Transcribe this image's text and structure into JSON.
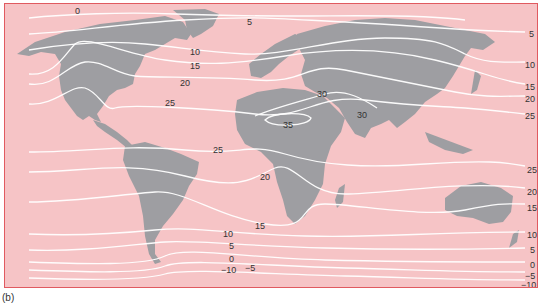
{
  "figure": {
    "caption": "(b)",
    "type": "isotherm world map",
    "colors": {
      "ocean": "#f6c4c6",
      "land": "#9e9ea2",
      "isotherm": "#ffffff",
      "border": "#e05a60",
      "text": "#333333"
    }
  },
  "labels": [
    {
      "id": "l0",
      "text": "0",
      "x": 70,
      "y": 5
    },
    {
      "id": "l5a",
      "text": "5",
      "x": 242,
      "y": 14
    },
    {
      "id": "l10a",
      "text": "10",
      "x": 185,
      "y": 44
    },
    {
      "id": "l15a",
      "text": "15",
      "x": 185,
      "y": 58
    },
    {
      "id": "l20a",
      "text": "20",
      "x": 175,
      "y": 75
    },
    {
      "id": "l25a",
      "text": "25",
      "x": 160,
      "y": 95
    },
    {
      "id": "l30a",
      "text": "30",
      "x": 312,
      "y": 86
    },
    {
      "id": "l35",
      "text": "35",
      "x": 278,
      "y": 117
    },
    {
      "id": "l30b",
      "text": "30",
      "x": 352,
      "y": 107
    },
    {
      "id": "l25b",
      "text": "25",
      "x": 208,
      "y": 142
    },
    {
      "id": "l5r",
      "text": "5",
      "x": 524,
      "y": 26
    },
    {
      "id": "l10r",
      "text": "10",
      "x": 524,
      "y": 57
    },
    {
      "id": "l15r",
      "text": "15",
      "x": 524,
      "y": 79
    },
    {
      "id": "l20r",
      "text": "20",
      "x": 524,
      "y": 91
    },
    {
      "id": "l25r",
      "text": "25",
      "x": 524,
      "y": 108
    },
    {
      "id": "l20b",
      "text": "20",
      "x": 255,
      "y": 169
    },
    {
      "id": "l15b",
      "text": "15",
      "x": 250,
      "y": 218
    },
    {
      "id": "l10b",
      "text": "10",
      "x": 222,
      "y": 226
    },
    {
      "id": "l5b",
      "text": "5",
      "x": 226,
      "y": 238
    },
    {
      "id": "l0b",
      "text": "0",
      "x": 226,
      "y": 251
    },
    {
      "id": "lm10b",
      "text": "−10",
      "x": 220,
      "y": 262
    },
    {
      "id": "lm5b",
      "text": "−5",
      "x": 243,
      "y": 260
    },
    {
      "id": "l25r2",
      "text": "25",
      "x": 526,
      "y": 162
    },
    {
      "id": "l20r2",
      "text": "20",
      "x": 526,
      "y": 184
    },
    {
      "id": "l15r2",
      "text": "15",
      "x": 526,
      "y": 200
    },
    {
      "id": "l10r2",
      "text": "10",
      "x": 526,
      "y": 227
    },
    {
      "id": "l5r2",
      "text": "5",
      "x": 528,
      "y": 242
    },
    {
      "id": "l0r2",
      "text": "0",
      "x": 528,
      "y": 257
    },
    {
      "id": "lm5r2",
      "text": "−5",
      "x": 524,
      "y": 269
    },
    {
      "id": "lm10r2",
      "text": "−10",
      "x": 520,
      "y": 278
    }
  ],
  "legend_values": [
    -10,
    -5,
    0,
    5,
    10,
    15,
    20,
    25,
    30,
    35
  ]
}
